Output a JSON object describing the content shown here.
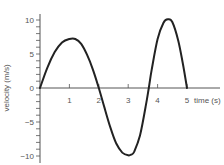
{
  "chart_data": {
    "type": "line",
    "title": "",
    "xlabel": "time (s)",
    "ylabel": "velocity (m/s)",
    "xlim": [
      0,
      5.5
    ],
    "ylim": [
      -10,
      10
    ],
    "x_ticks": [
      1,
      2,
      3,
      4,
      5
    ],
    "y_ticks": [
      -10,
      -5,
      0,
      5,
      10
    ],
    "y_minor_tick_step": 1,
    "grid": false,
    "legend": null,
    "series": [
      {
        "name": "velocity",
        "x": [
          0,
          0.25,
          0.5,
          0.75,
          1.0,
          1.2,
          1.4,
          1.6,
          1.8,
          2.0,
          2.2,
          2.4,
          2.6,
          2.8,
          3.0,
          3.1,
          3.2,
          3.4,
          3.6,
          3.7,
          3.8,
          4.0,
          4.2,
          4.35,
          4.5,
          4.7,
          4.85,
          5.0
        ],
        "values": [
          0,
          3.0,
          5.3,
          6.7,
          7.2,
          7.2,
          6.5,
          4.9,
          2.7,
          0,
          -3.0,
          -5.9,
          -8.2,
          -9.5,
          -9.9,
          -9.8,
          -9.4,
          -7.0,
          -2.6,
          0,
          2.7,
          7.2,
          9.6,
          10.1,
          9.7,
          7.0,
          3.8,
          0
        ]
      }
    ],
    "key_points": {
      "first_peak": {
        "t": 1.2,
        "v": 7.2
      },
      "zero_crossings": [
        0,
        2.0,
        3.7,
        5.0
      ],
      "trough": {
        "t": 3.1,
        "v": -9.8
      },
      "second_peak": {
        "t": 4.35,
        "v": 10.1
      }
    },
    "colors": {
      "curve": "#222222",
      "axis": "#555555",
      "text": "#555555"
    }
  }
}
